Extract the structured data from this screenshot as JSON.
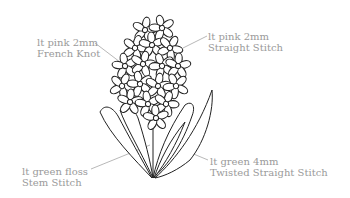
{
  "diagram": {
    "labels": [
      {
        "id": "french-knot",
        "line1": "lt pink  2mm",
        "line2": "French Knot"
      },
      {
        "id": "straight-stitch",
        "line1": "lt pink  2mm",
        "line2": "Straight Stitch"
      },
      {
        "id": "stem-stitch",
        "line1": "lt green floss",
        "line2": "Stem Stitch"
      },
      {
        "id": "twisted-straight-stitch",
        "line1": "lt green  4mm",
        "line2": "Twisted Straight Stitch"
      }
    ],
    "colors": {
      "line_art": "#222222",
      "label_text": "#9a9a9a",
      "background": "#ffffff"
    }
  }
}
